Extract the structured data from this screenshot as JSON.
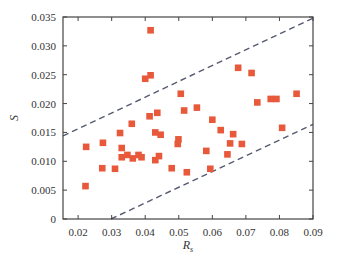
{
  "chart_data": {
    "type": "scatter",
    "title": "",
    "xlabel": "R",
    "xlabel_subscript": "s",
    "ylabel": "S",
    "xlim": [
      0.0155,
      0.09
    ],
    "ylim": [
      0,
      0.035
    ],
    "xticks": [
      0.02,
      0.03,
      0.04,
      0.05,
      0.06,
      0.07,
      0.08,
      0.09
    ],
    "xtick_labels": [
      "0.02",
      "0.03",
      "0.04",
      "0.05",
      "0.06",
      "0.07",
      "0.08",
      "0.09"
    ],
    "yticks": [
      0,
      0.005,
      0.01,
      0.015,
      0.02,
      0.025,
      0.03,
      0.035
    ],
    "ytick_labels": [
      "0",
      "0.005",
      "0.010",
      "0.015",
      "0.020",
      "0.025",
      "0.030",
      "0.035"
    ],
    "grid": false,
    "legend": null,
    "marker": "square",
    "marker_color": "#e8583a",
    "line_color": "#555a70",
    "series": [
      {
        "name": "data",
        "points": [
          [
            0.0224,
            0.0125
          ],
          [
            0.0274,
            0.0132
          ],
          [
            0.0222,
            0.0057
          ],
          [
            0.0272,
            0.0088
          ],
          [
            0.031,
            0.0087
          ],
          [
            0.0325,
            0.0149
          ],
          [
            0.036,
            0.0165
          ],
          [
            0.033,
            0.0123
          ],
          [
            0.033,
            0.0107
          ],
          [
            0.0347,
            0.0111
          ],
          [
            0.0363,
            0.0105
          ],
          [
            0.038,
            0.0111
          ],
          [
            0.0389,
            0.0107
          ],
          [
            0.0416,
            0.0327
          ],
          [
            0.04,
            0.0243
          ],
          [
            0.0416,
            0.0249
          ],
          [
            0.0413,
            0.0178
          ],
          [
            0.0436,
            0.0184
          ],
          [
            0.043,
            0.015
          ],
          [
            0.0446,
            0.0146
          ],
          [
            0.043,
            0.0102
          ],
          [
            0.0441,
            0.0109
          ],
          [
            0.0479,
            0.0088
          ],
          [
            0.0497,
            0.013
          ],
          [
            0.0499,
            0.0138
          ],
          [
            0.0506,
            0.0217
          ],
          [
            0.0516,
            0.0188
          ],
          [
            0.0524,
            0.0081
          ],
          [
            0.0554,
            0.0193
          ],
          [
            0.0582,
            0.0118
          ],
          [
            0.0594,
            0.0087
          ],
          [
            0.06,
            0.0172
          ],
          [
            0.0625,
            0.0154
          ],
          [
            0.0645,
            0.0112
          ],
          [
            0.0653,
            0.0131
          ],
          [
            0.0662,
            0.0147
          ],
          [
            0.0677,
            0.0262
          ],
          [
            0.0688,
            0.013
          ],
          [
            0.0717,
            0.0253
          ],
          [
            0.0734,
            0.0202
          ],
          [
            0.0774,
            0.0208
          ],
          [
            0.0791,
            0.0208
          ],
          [
            0.0808,
            0.0158
          ],
          [
            0.0851,
            0.0217
          ]
        ]
      }
    ],
    "reference_lines": [
      {
        "name": "upper-bound",
        "style": "dashed",
        "from": [
          0.0155,
          0.0144
        ],
        "to": [
          0.09,
          0.0348
        ]
      },
      {
        "name": "lower-bound",
        "style": "dashed",
        "from": [
          0.0298,
          0.0
        ],
        "to": [
          0.09,
          0.0164
        ]
      }
    ]
  }
}
